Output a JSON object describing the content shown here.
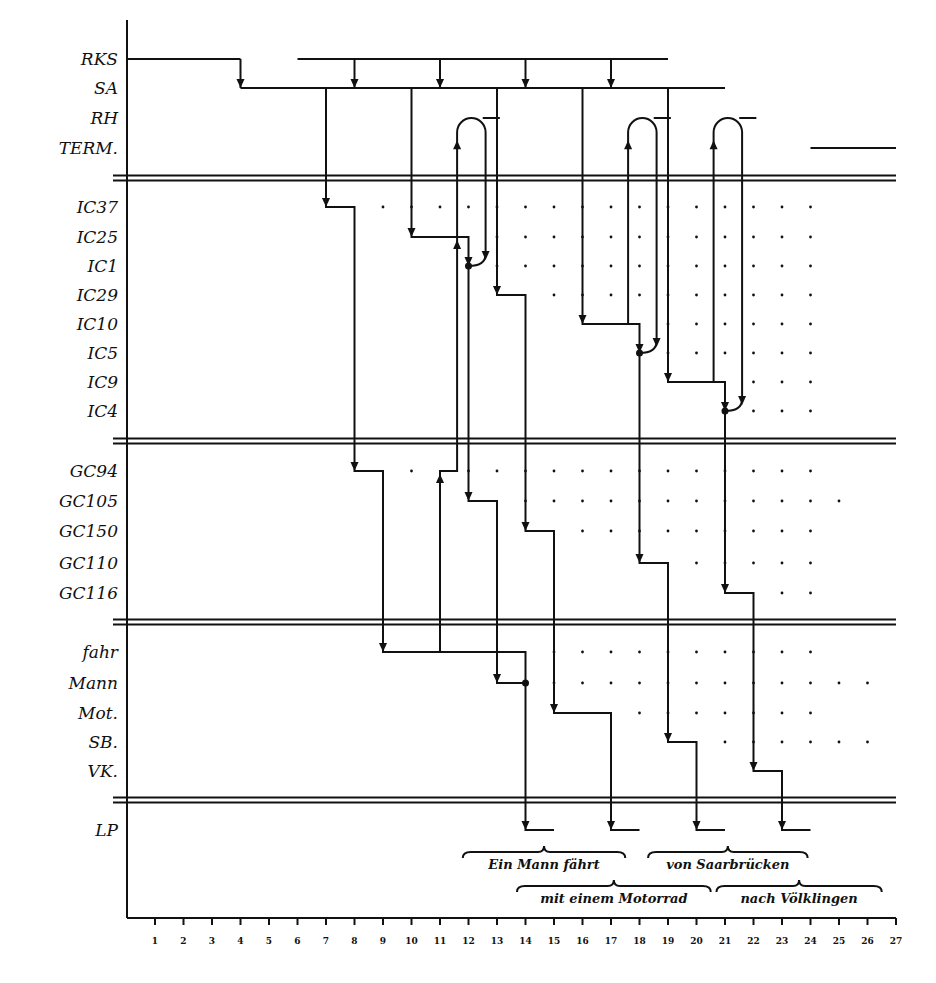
{
  "diagram": {
    "type": "process-timeline",
    "axis": {
      "ticks": [
        "1",
        "2",
        "3",
        "4",
        "5",
        "6",
        "7",
        "8",
        "9",
        "10",
        "11",
        "12",
        "13",
        "14",
        "15",
        "16",
        "17",
        "18",
        "19",
        "20",
        "21",
        "22",
        "23",
        "24",
        "25",
        "26",
        "27"
      ]
    },
    "groups": [
      {
        "name": "control",
        "rows": [
          "RKS",
          "SA",
          "RH",
          "TERM."
        ]
      },
      {
        "name": "ic",
        "rows": [
          "IC37",
          "IC25",
          "IC1",
          "IC29",
          "IC10",
          "IC5",
          "IC9",
          "IC4"
        ]
      },
      {
        "name": "gc",
        "rows": [
          "GC94",
          "GC105",
          "GC150",
          "GC110",
          "GC116"
        ]
      },
      {
        "name": "words",
        "rows": [
          "fahr",
          "Mann",
          "Mot.",
          "SB.",
          "VK."
        ]
      },
      {
        "name": "lp",
        "rows": [
          "LP"
        ]
      }
    ],
    "row_y": {
      "RKS": 59,
      "SA": 88,
      "RH": 118,
      "TERM.": 148,
      "IC37": 207,
      "IC25": 237,
      "IC1": 266,
      "IC29": 295,
      "IC10": 324,
      "IC5": 353,
      "IC9": 382,
      "IC4": 411,
      "GC94": 471,
      "GC105": 501,
      "GC150": 531,
      "GC110": 563,
      "GC116": 593,
      "fahr": 652,
      "Mann": 683,
      "Mot.": 713,
      "SB.": 742,
      "VK.": 771,
      "LP": 830
    },
    "separators": [
      178,
      441,
      622,
      800
    ],
    "phrases": [
      {
        "text": "Ein Mann fährt",
        "from": 11.8,
        "to": 17.5,
        "level": 1
      },
      {
        "text": "von Saarbrücken",
        "from": 18.3,
        "to": 23.9,
        "level": 1
      },
      {
        "text": "mit einem Motorrad",
        "from": 13.7,
        "to": 20.5,
        "level": 2
      },
      {
        "text": "nach Völklingen",
        "from": 20.7,
        "to": 26.5,
        "level": 2
      }
    ],
    "horizontal_lines": [
      {
        "row": "RKS",
        "from": 0,
        "to": 4
      },
      {
        "row": "RKS",
        "from": 6,
        "to": 19
      },
      {
        "row": "SA",
        "from": 4,
        "to": 21
      },
      {
        "row": "TERM.",
        "from": 24,
        "to": 27
      },
      {
        "row": "RH",
        "from": 12.5,
        "to": 13.1
      },
      {
        "row": "RH",
        "from": 18.5,
        "to": 19.1
      },
      {
        "row": "RH",
        "from": 21.5,
        "to": 22.1
      }
    ],
    "control_arrows": [
      8,
      11,
      14,
      17
    ],
    "paths": [
      {
        "pts": [
          [
            7,
            "SA"
          ],
          [
            7,
            "IC37"
          ],
          [
            8,
            "IC37"
          ],
          [
            8,
            "GC94"
          ],
          [
            9,
            "GC94"
          ],
          [
            9,
            "fahr"
          ],
          [
            14,
            "fahr"
          ],
          [
            14,
            "LP"
          ],
          [
            15,
            "LP"
          ]
        ]
      },
      {
        "pts": [
          [
            10,
            "SA"
          ],
          [
            10,
            "IC25"
          ],
          [
            12,
            "IC25"
          ],
          [
            12,
            "IC1"
          ],
          [
            12,
            "GC105"
          ],
          [
            13,
            "GC105"
          ],
          [
            13,
            "Mann"
          ],
          [
            14,
            "Mann"
          ]
        ]
      },
      {
        "pts": [
          [
            13,
            "SA"
          ],
          [
            13,
            "IC29"
          ],
          [
            14,
            "IC29"
          ],
          [
            14,
            "GC150"
          ],
          [
            15,
            "GC150"
          ],
          [
            15,
            "Mot."
          ],
          [
            17,
            "Mot."
          ],
          [
            17,
            "LP"
          ],
          [
            18,
            "LP"
          ]
        ]
      },
      {
        "pts": [
          [
            16,
            "SA"
          ],
          [
            16,
            "IC10"
          ],
          [
            18,
            "IC10"
          ],
          [
            18,
            "IC5"
          ],
          [
            18,
            "GC110"
          ],
          [
            19,
            "GC110"
          ],
          [
            19,
            "SB."
          ],
          [
            20,
            "SB."
          ],
          [
            20,
            "LP"
          ],
          [
            21,
            "LP"
          ]
        ]
      },
      {
        "pts": [
          [
            19,
            "SA"
          ],
          [
            19,
            "IC9"
          ],
          [
            21,
            "IC9"
          ],
          [
            21,
            "IC4"
          ],
          [
            21,
            "GC116"
          ],
          [
            22,
            "GC116"
          ],
          [
            22,
            "VK."
          ],
          [
            23,
            "VK."
          ],
          [
            23,
            "LP"
          ],
          [
            24,
            "LP"
          ]
        ]
      },
      {
        "pts": [
          [
            11,
            "fahr"
          ],
          [
            11,
            "GC94"
          ],
          [
            11.6,
            "GC94"
          ],
          [
            11.6,
            "IC25"
          ]
        ]
      }
    ],
    "loops": [
      {
        "up": 11.6,
        "down": 12.6,
        "from_row": "IC25",
        "arrow_row": "IC1",
        "join": 12
      },
      {
        "up": 17.6,
        "down": 18.6,
        "from_row": "IC10",
        "arrow_row": "IC5",
        "join": 18
      },
      {
        "up": 20.6,
        "down": 21.6,
        "from_row": "IC9",
        "arrow_row": "IC4",
        "join": 21
      }
    ],
    "junction_dots": [
      [
        12,
        "IC1"
      ],
      [
        18,
        "IC5"
      ],
      [
        21,
        "IC4"
      ],
      [
        14,
        "Mann"
      ]
    ],
    "dot_grid": [
      {
        "row": "IC37",
        "cols": [
          9,
          10,
          11,
          12,
          13,
          14,
          15,
          16,
          17,
          18,
          19,
          20,
          21,
          22,
          23,
          24
        ]
      },
      {
        "row": "IC25",
        "cols": [
          13,
          14,
          15,
          16,
          17,
          18,
          19,
          20,
          21,
          22,
          23,
          24
        ]
      },
      {
        "row": "IC1",
        "cols": [
          13,
          14,
          15,
          16,
          17,
          18,
          19,
          20,
          21,
          22,
          23,
          24
        ]
      },
      {
        "row": "IC29",
        "cols": [
          15,
          16,
          17,
          18,
          19,
          20,
          21,
          22,
          23,
          24
        ]
      },
      {
        "row": "IC10",
        "cols": [
          19,
          20,
          21,
          22,
          23,
          24
        ]
      },
      {
        "row": "IC5",
        "cols": [
          19,
          20,
          21,
          22,
          23,
          24
        ]
      },
      {
        "row": "IC9",
        "cols": [
          22,
          23,
          24
        ]
      },
      {
        "row": "IC4",
        "cols": [
          22,
          23,
          24
        ]
      },
      {
        "row": "GC94",
        "cols": [
          10,
          12,
          13,
          14,
          15,
          16,
          17,
          18,
          19,
          20,
          21,
          22,
          23,
          24
        ]
      },
      {
        "row": "GC105",
        "cols": [
          14,
          15,
          16,
          17,
          18,
          19,
          20,
          21,
          22,
          23,
          24,
          25
        ]
      },
      {
        "row": "GC150",
        "cols": [
          16,
          17,
          18,
          19,
          20,
          21,
          22,
          23,
          24
        ]
      },
      {
        "row": "GC110",
        "cols": [
          20,
          21,
          22,
          23,
          24
        ]
      },
      {
        "row": "GC116",
        "cols": [
          23,
          24
        ]
      },
      {
        "row": "fahr",
        "cols": [
          15,
          16,
          17,
          18,
          19,
          20,
          21,
          22,
          23,
          24
        ]
      },
      {
        "row": "Mann",
        "cols": [
          15,
          16,
          17,
          18,
          19,
          20,
          21,
          22,
          23,
          24,
          25,
          26
        ]
      },
      {
        "row": "Mot.",
        "cols": [
          18,
          19,
          20,
          21,
          22,
          23,
          24
        ]
      },
      {
        "row": "SB.",
        "cols": [
          21,
          22,
          23,
          24,
          25,
          26
        ]
      },
      {
        "row": "VK.",
        "cols": []
      }
    ]
  }
}
